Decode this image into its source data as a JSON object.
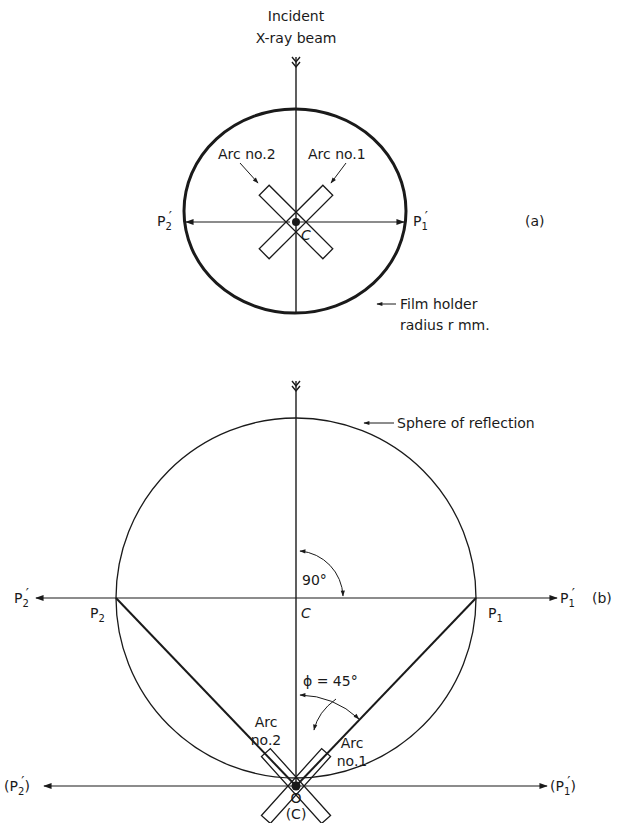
{
  "figure_a": {
    "tag": "(a)",
    "beam_label_line1": "Incident",
    "beam_label_line2": "X-ray beam",
    "arc1_label": "Arc no.1",
    "arc2_label": "Arc no.2",
    "center_label": "C",
    "left_point": {
      "base": "P",
      "sub": "2",
      "prime": "′"
    },
    "right_point": {
      "base": "P",
      "sub": "1",
      "prime": "′"
    },
    "film_label_line1": "Film holder",
    "film_label_line2": "radius  r mm."
  },
  "figure_b": {
    "tag": "(b)",
    "sphere_label": "Sphere of reflection",
    "angle_90_label": "90°",
    "phi_label": "ϕ = 45°",
    "center_label": "C",
    "p1_label": {
      "base": "P",
      "sub": "1"
    },
    "p2_label": {
      "base": "P",
      "sub": "2"
    },
    "left_far_point": {
      "base": "P",
      "sub": "2",
      "prime": "′"
    },
    "right_far_point": {
      "base": "P",
      "sub": "1",
      "prime": "′"
    },
    "bottom_left_point": {
      "open": "(",
      "base": "P",
      "sub": "2",
      "prime": "′",
      "close": ")"
    },
    "bottom_right_point": {
      "open": "(",
      "base": "P",
      "sub": "1",
      "prime": "′",
      "close": ")"
    },
    "arc1_label_line1": "Arc",
    "arc1_label_line2": "no.1",
    "arc2_label_line1": "Arc",
    "arc2_label_line2": "no.2",
    "origin_label": "O",
    "origin_center_label": "(C)"
  },
  "colors": {
    "ink": "#1a1a1a",
    "background": "#ffffff"
  }
}
